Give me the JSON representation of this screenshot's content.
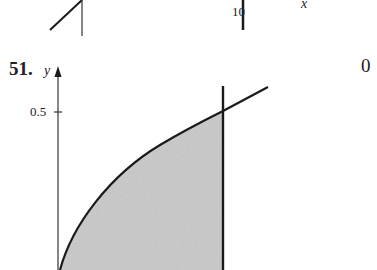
{
  "top_figure_fragment": {
    "tick_label": "10",
    "axis_label_x": "x"
  },
  "problem": {
    "number": "51.",
    "axis_label_y": "y",
    "y_tick_label": "0.5",
    "side_label": "0"
  },
  "colors": {
    "line": "#1a1a1a",
    "shade": "#c9c9c9",
    "text": "#222222"
  }
}
